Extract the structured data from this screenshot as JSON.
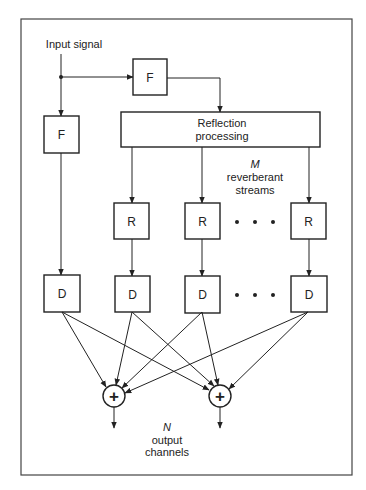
{
  "diagram": {
    "input_label": "Input signal",
    "filter_top": "F",
    "filter_left": "F",
    "reflection": {
      "line1": "Reflection",
      "line2": "processing"
    },
    "reverb_label": {
      "m": "M",
      "line1": "reverberant",
      "line2": "streams"
    },
    "reverb_boxes": [
      "R",
      "R",
      "R"
    ],
    "delay_boxes": [
      "D",
      "D",
      "D",
      "D"
    ],
    "ellipsis": "• • •",
    "summer_symbol": "+",
    "output_label": {
      "n": "N",
      "line1": "output",
      "line2": "channels"
    },
    "colors": {
      "stroke": "#222222",
      "background": "#ffffff"
    }
  }
}
